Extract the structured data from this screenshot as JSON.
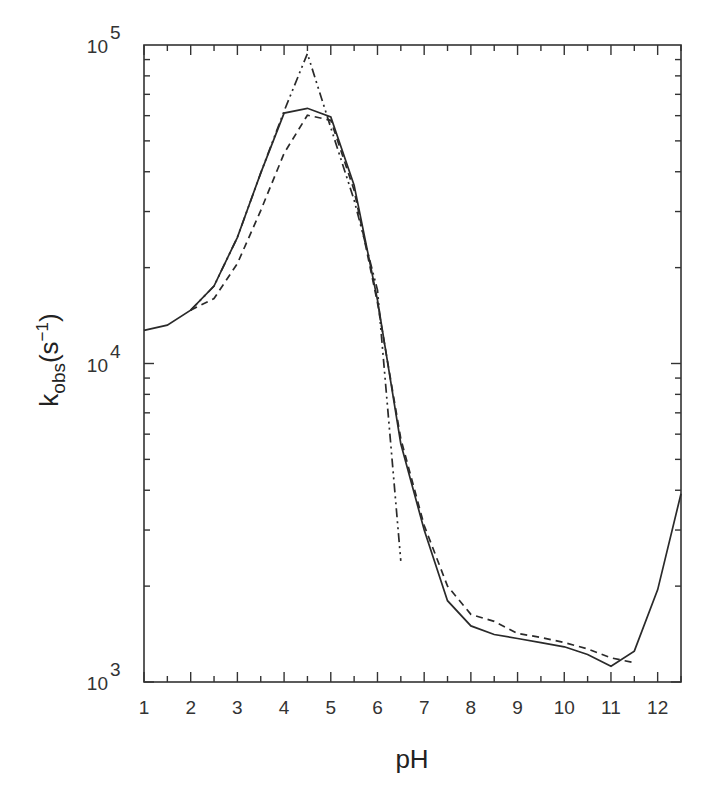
{
  "chart_data": {
    "type": "line",
    "title": "",
    "xlabel": "pH",
    "ylabel": "k_obs(s^-1)",
    "ylabel_parts": {
      "base": "k",
      "sub": "obs",
      "paren_open": "(s",
      "sup": "−1",
      "paren_close": ")"
    },
    "xlim": [
      1,
      12.5
    ],
    "ylim": [
      1000,
      100000
    ],
    "yscale": "log",
    "grid": false,
    "legend": null,
    "x_ticks": [
      1,
      2,
      3,
      4,
      5,
      6,
      7,
      8,
      9,
      10,
      11,
      12
    ],
    "x_tick_labels": [
      "1",
      "2",
      "3",
      "4",
      "5",
      "6",
      "7",
      "8",
      "9",
      "10",
      "11",
      "12"
    ],
    "y_ticks": [
      1000,
      10000,
      100000
    ],
    "y_tick_labels": [
      {
        "base": "10",
        "exp": "3"
      },
      {
        "base": "10",
        "exp": "4"
      },
      {
        "base": "10",
        "exp": "5"
      }
    ],
    "series": [
      {
        "name": "solid",
        "style": "solid",
        "x": [
          1,
          1.5,
          2,
          2.5,
          3,
          3.5,
          4,
          4.5,
          5,
          5.5,
          6,
          6.5,
          7,
          7.5,
          8,
          8.5,
          9,
          9.5,
          10,
          10.5,
          11,
          11.5,
          12,
          12.5
        ],
        "y": [
          12700,
          13200,
          14700,
          17500,
          24900,
          39600,
          61100,
          63300,
          59400,
          36300,
          15800,
          5600,
          3000,
          1800,
          1500,
          1410,
          1370,
          1330,
          1290,
          1220,
          1120,
          1250,
          1950,
          3900
        ]
      },
      {
        "name": "dashed",
        "style": "dashed",
        "x": [
          2,
          2.5,
          3,
          3.5,
          4,
          4.5,
          5,
          5.5,
          6,
          6.5,
          7,
          7.5,
          8,
          8.5,
          9,
          9.5,
          10,
          10.5,
          11,
          11.5
        ],
        "y": [
          14700,
          16000,
          20600,
          30200,
          45700,
          60200,
          58000,
          35000,
          15500,
          5800,
          3100,
          2000,
          1630,
          1550,
          1420,
          1380,
          1330,
          1270,
          1190,
          1150
        ]
      },
      {
        "name": "dash-dot-dot",
        "style": "dashdotdot",
        "x": [
          2,
          2.5,
          3,
          3.5,
          4,
          4.5,
          5,
          5.5,
          6,
          6.5
        ],
        "y": [
          14700,
          17500,
          24900,
          39600,
          62000,
          94000,
          55000,
          32600,
          17000,
          2400
        ]
      }
    ]
  },
  "colors": {
    "axis": "#333333",
    "line": "#2a2a2a",
    "background": "#ffffff"
  }
}
